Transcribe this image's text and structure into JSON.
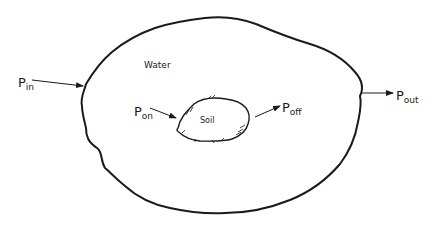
{
  "diagram": {
    "region_outer_label": "Water",
    "region_inner_label": "Soil",
    "flows": {
      "in": {
        "symbol": "P",
        "subscript": "in"
      },
      "out": {
        "symbol": "P",
        "subscript": "out"
      },
      "on": {
        "symbol": "P",
        "subscript": "on"
      },
      "off": {
        "symbol": "P",
        "subscript": "off"
      }
    },
    "colors": {
      "line": "#1a1a1a",
      "background": "#ffffff"
    }
  }
}
